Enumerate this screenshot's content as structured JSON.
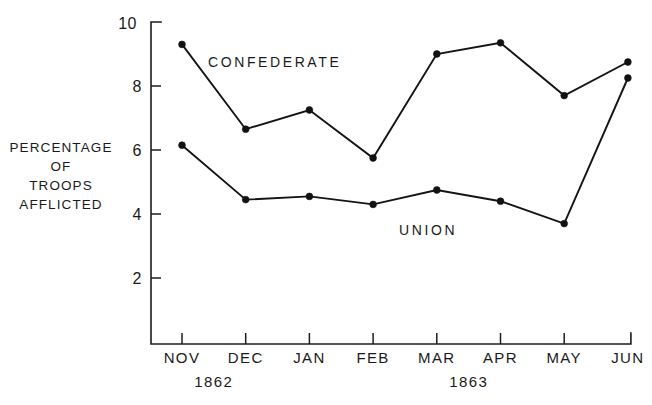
{
  "chart_data": {
    "type": "line",
    "title": "",
    "subtitle": "",
    "xlabel": "",
    "ylabel": "PERCENTAGE OF TROOPS AFFLICTED",
    "ylabel_lines": [
      "PERCENTAGE",
      "OF",
      "TROOPS",
      "AFFLICTED"
    ],
    "categories": [
      "NOV",
      "DEC",
      "JAN",
      "FEB",
      "MAR",
      "APR",
      "MAY",
      "JUN"
    ],
    "x_group_labels": [
      {
        "text": "1862",
        "start_category": "NOV",
        "end_category": "DEC"
      },
      {
        "text": "1863",
        "start_category": "JAN",
        "end_category": "JUN"
      }
    ],
    "series": [
      {
        "name": "CONFEDERATE",
        "values": [
          9.3,
          6.65,
          7.25,
          5.75,
          9.0,
          9.35,
          7.7,
          8.75
        ],
        "label_position": {
          "category": "NOV",
          "value": 8.6
        }
      },
      {
        "name": "UNION",
        "values": [
          6.15,
          4.45,
          4.55,
          4.3,
          4.75,
          4.4,
          3.7,
          8.25
        ],
        "label_position": {
          "category": "FEB",
          "value": 3.35
        }
      }
    ],
    "ylim": [
      1.5,
      10
    ],
    "yticks": [
      2,
      4,
      6,
      8,
      10
    ],
    "ytick_labels": [
      "2",
      "4",
      "6",
      "8",
      "10"
    ],
    "grid": false,
    "legend": "inline-annotations",
    "marker": "filled-circle",
    "line_color": "#141414",
    "axis_color": "#1c1c1c",
    "background": "#ffffff"
  },
  "axis_labels": {
    "y": {
      "line1": "PERCENTAGE",
      "line2": "OF",
      "line3": "TROOPS",
      "line4": "AFFLICTED"
    }
  }
}
